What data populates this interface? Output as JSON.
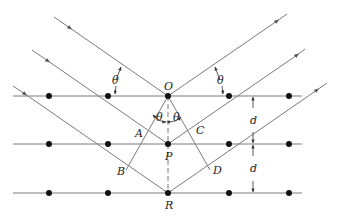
{
  "diagram": {
    "colors": {
      "line": "#7a7a7a",
      "dot": "#111111",
      "text": "#222222",
      "background": "#ffffff"
    },
    "labels": {
      "O": "O",
      "P": "P",
      "R": "R",
      "A": "A",
      "B": "B",
      "C": "C",
      "D": "D",
      "theta": "θ",
      "spacing": "d"
    },
    "lattice_planes": [
      {
        "name": "top-plane",
        "y": 96
      },
      {
        "name": "middle-plane",
        "y": 144
      },
      {
        "name": "bottom-plane",
        "y": 193
      }
    ],
    "atom_x_positions": [
      49,
      108,
      168,
      229,
      289
    ],
    "angle_labels": [
      "θ",
      "θ",
      "θ",
      "θ"
    ],
    "spacing_labels": [
      "d",
      "d"
    ]
  }
}
